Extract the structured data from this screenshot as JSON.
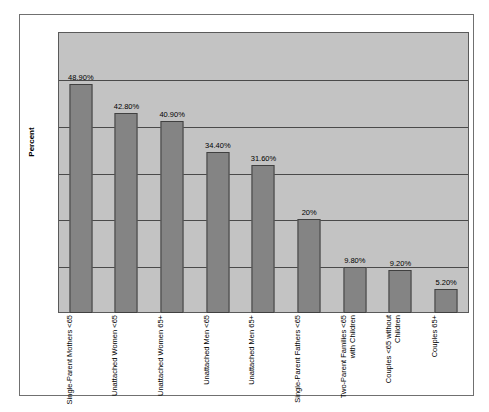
{
  "chart_data": {
    "type": "bar",
    "title": "",
    "xlabel": "",
    "ylabel": "Percent",
    "ylim": [
      0,
      60
    ],
    "ytick_interval": 10,
    "grid": true,
    "gridlines": [
      10,
      20,
      30,
      40,
      50
    ],
    "legend": "none",
    "value_label_suffix": "%",
    "categories": [
      "Single-Parent Mothers <65",
      "Unattached Women <65",
      "Unattached Women 65+",
      "Unattached Men <65",
      "Unattached Men 65+",
      "Single-Parent Fathers <65",
      "Two-Parent Families <65 with Children",
      "Couples <65 without Children",
      "Couples 65+"
    ],
    "values": [
      48.9,
      42.8,
      40.9,
      34.4,
      31.6,
      20,
      9.8,
      9.2,
      5.2
    ],
    "value_labels": [
      "48.90%",
      "42.80%",
      "40.90%",
      "34.40%",
      "31.60%",
      "20%",
      "9.80%",
      "9.20%",
      "5.20%"
    ],
    "colors": {
      "bar_fill": "#848484",
      "bar_border": "#404040",
      "plot_background": "#c3c3c3",
      "gridline": "#4a4a4a",
      "plot_border": "#5a5a5a",
      "frame_border": "#707070",
      "page_background": "#ffffff",
      "text": "#000000"
    }
  },
  "y_axis": {
    "title": "Percent"
  }
}
